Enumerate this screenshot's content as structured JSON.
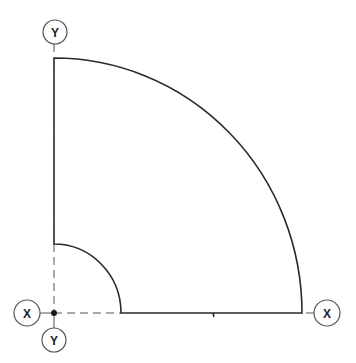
{
  "diagram": {
    "colors": {
      "outline": "#2a2a2a",
      "axis": "#555555",
      "background": "#ffffff"
    },
    "origin": {
      "x": 54,
      "y": 313
    },
    "inner_radius": 68,
    "outer_radius_x": 248,
    "outer_radius_y": 255,
    "labels": {
      "y_axis_top": "Y",
      "y_axis_bottom": "Y",
      "x_axis_left": "X",
      "x_axis_right": "X"
    }
  }
}
